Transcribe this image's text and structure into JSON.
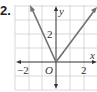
{
  "problem": {
    "number": "2."
  },
  "graph": {
    "x_axis_label": "x",
    "y_axis_label": "y",
    "origin_label": "O",
    "x_ticks": [
      {
        "label": "−2",
        "value": -2
      },
      {
        "label": "2",
        "value": 2
      }
    ],
    "y_ticks": [
      {
        "label": "2",
        "value": 2
      }
    ],
    "function_description": "V-shaped absolute value graph with vertex at origin",
    "colors": {
      "grid": "#cfcfcf",
      "axis": "#333333",
      "curve": "#707070"
    }
  }
}
